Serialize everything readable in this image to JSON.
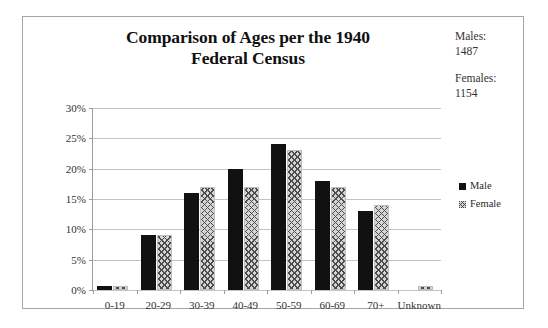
{
  "chart_data": {
    "type": "bar",
    "title": "Comparison of Ages per the 1940 Federal Census",
    "xlabel": "",
    "ylabel": "",
    "ylim": [
      0,
      30
    ],
    "ytick_labels": [
      "0%",
      "5%",
      "10%",
      "15%",
      "20%",
      "25%",
      "30%"
    ],
    "ytick_values": [
      0,
      5,
      10,
      15,
      20,
      25,
      30
    ],
    "grid": true,
    "legend_position": "right",
    "categories": [
      "0-19",
      "20-29",
      "30-39",
      "40-49",
      "50-59",
      "60-69",
      "70+",
      "Unknown"
    ],
    "series": [
      {
        "name": "Male",
        "values": [
          0.7,
          9,
          16,
          20,
          24,
          18,
          13,
          0
        ]
      },
      {
        "name": "Female",
        "values": [
          0.7,
          9,
          17,
          17,
          23,
          17,
          14,
          0.6
        ]
      }
    ],
    "annotations": [
      {
        "label": "Males:",
        "value": "1487"
      },
      {
        "label": "Females:",
        "value": "1154"
      }
    ]
  },
  "title": {
    "line1": "Comparison of Ages per the 1940",
    "line2": "Federal Census",
    "full": "Comparison of Ages per the 1940 Federal Census"
  },
  "side_stats": [
    {
      "label": "Males:",
      "value": "1487"
    },
    {
      "label": "Females:",
      "value": "1154"
    }
  ],
  "legend": {
    "items": [
      {
        "label": "Male",
        "swatch": "solid-black-square-icon",
        "color": "#111111"
      },
      {
        "label": "Female",
        "swatch": "crosshatch-square-icon",
        "color": "#d6d6d6"
      }
    ]
  },
  "axes": {
    "y_ticks": [
      "0%",
      "5%",
      "10%",
      "15%",
      "20%",
      "25%",
      "30%"
    ],
    "x_ticks": [
      "0-19",
      "20-29",
      "30-39",
      "40-49",
      "50-59",
      "60-69",
      "70+",
      "Unknown"
    ]
  }
}
